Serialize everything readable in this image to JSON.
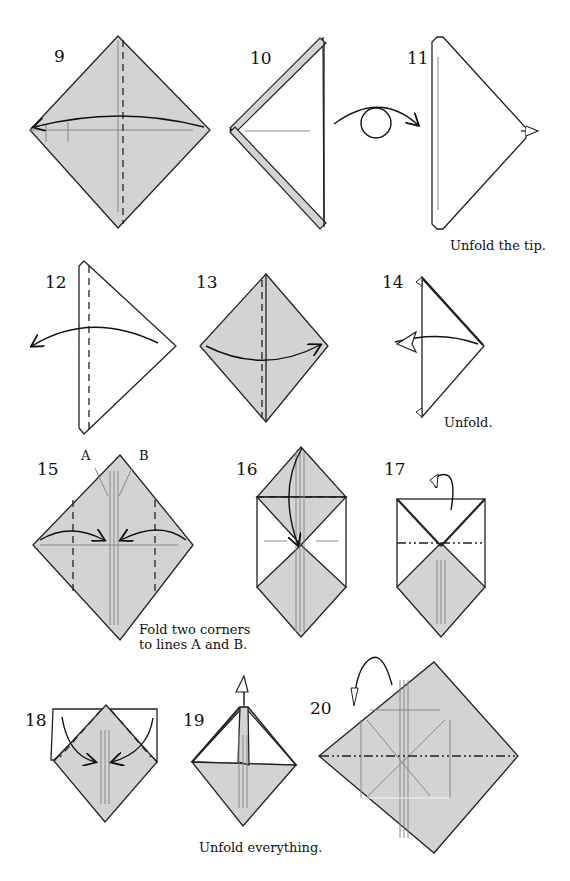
{
  "steps": [
    {
      "number": "9"
    },
    {
      "number": "10"
    },
    {
      "number": "11",
      "caption": "Unfold the tip."
    },
    {
      "number": "12"
    },
    {
      "number": "13"
    },
    {
      "number": "14",
      "caption": "Unfold."
    },
    {
      "number": "15",
      "caption_lines": [
        "Fold two corners",
        "to lines A and B."
      ],
      "line_labels": [
        "A",
        "B"
      ]
    },
    {
      "number": "16"
    },
    {
      "number": "17"
    },
    {
      "number": "18"
    },
    {
      "number": "19",
      "caption": "Unfold everything."
    },
    {
      "number": "20"
    }
  ],
  "colors": {
    "paper_gray": "#d3d3d3",
    "line": "#222222",
    "crease": "#888888"
  }
}
